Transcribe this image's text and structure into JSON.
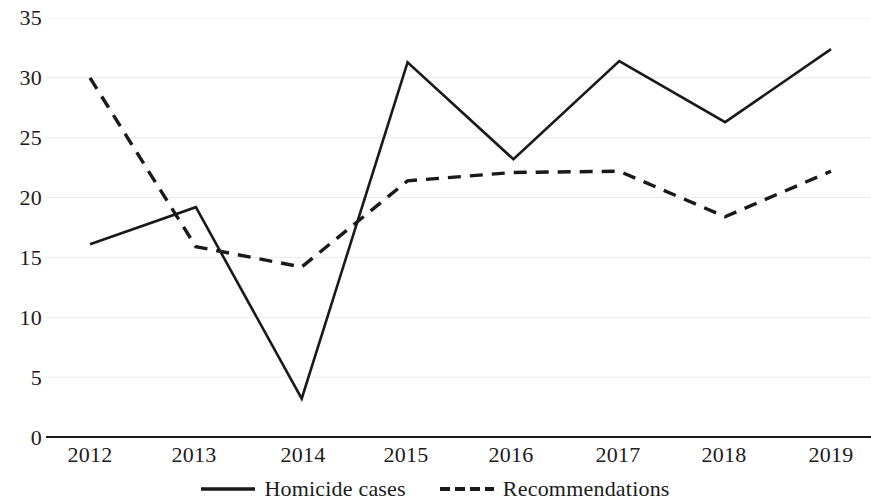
{
  "chart_data": {
    "type": "line",
    "title": "",
    "subtitle": "",
    "xlabel": "",
    "ylabel": "",
    "categories": [
      "2012",
      "2013",
      "2014",
      "2015",
      "2016",
      "2017",
      "2018",
      "2019"
    ],
    "ylim": [
      0,
      35
    ],
    "yticks": [
      0,
      5,
      10,
      15,
      20,
      25,
      30,
      35
    ],
    "ytick_labels": [
      "0",
      "5",
      "10",
      "15",
      "20",
      "25",
      "30",
      "35"
    ],
    "grid": true,
    "grid_axis": "y",
    "legend_position": "bottom",
    "series": [
      {
        "name": "Homicide cases",
        "style": "solid",
        "color": "#1a1a1a",
        "values": [
          16.1,
          19.2,
          3.2,
          31.3,
          23.2,
          31.4,
          26.3,
          32.4
        ]
      },
      {
        "name": "Recommendations",
        "style": "dashed",
        "color": "#1a1a1a",
        "values": [
          30.0,
          15.9,
          14.2,
          21.4,
          22.1,
          22.2,
          18.4,
          22.2
        ]
      }
    ]
  },
  "legend": {
    "items": [
      {
        "label": "Homicide cases",
        "icon": "solid-line-icon"
      },
      {
        "label": "Recommendations",
        "icon": "dashed-line-icon"
      }
    ]
  }
}
